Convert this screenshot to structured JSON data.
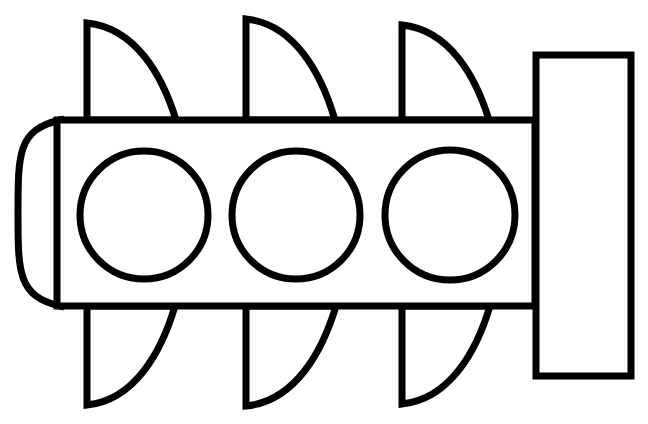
{
  "figure": {
    "stroke_color": "#000000",
    "background_color": "#ffffff",
    "body": {
      "x": 57,
      "y": 120,
      "width": 478,
      "height": 186
    },
    "nose": {
      "x_left": 18,
      "x_right": 60,
      "y_top": 120,
      "y_bottom": 306
    },
    "tail": {
      "x": 536,
      "y": 55,
      "width": 95,
      "height": 321
    },
    "circles": [
      {
        "cx": 144,
        "cy": 215,
        "r": 64
      },
      {
        "cx": 296,
        "cy": 215,
        "r": 64
      },
      {
        "cx": 450,
        "cy": 215,
        "r": 65
      }
    ],
    "top_fins": [
      {
        "x": 87,
        "top": 23,
        "end_x": 176
      },
      {
        "x": 246,
        "top": 19,
        "end_x": 335
      },
      {
        "x": 402,
        "top": 25,
        "end_x": 489
      }
    ],
    "bottom_fins": [
      {
        "x": 87,
        "bottom": 405,
        "end_x": 175
      },
      {
        "x": 246,
        "bottom": 406,
        "end_x": 336
      },
      {
        "x": 402,
        "bottom": 404,
        "end_x": 490
      }
    ]
  }
}
